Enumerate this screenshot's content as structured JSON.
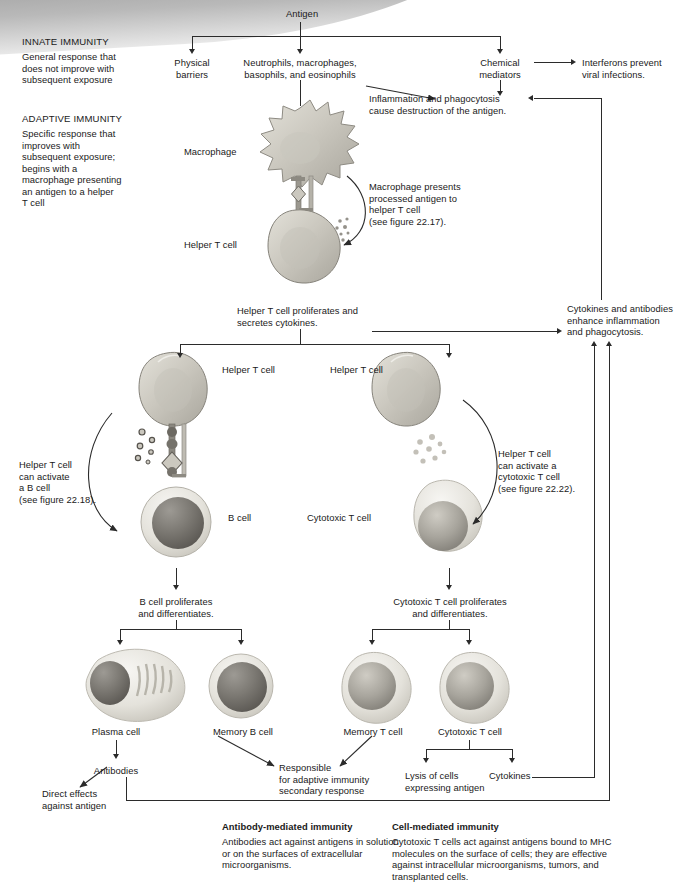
{
  "sidebar": {
    "innate": {
      "heading": "INNATE IMMUNITY",
      "body_lines": [
        "General response that",
        "does not improve with",
        "subsequent exposure"
      ]
    },
    "adaptive": {
      "heading": "ADAPTIVE IMMUNITY",
      "body_lines": [
        "Specific response that",
        "improves with",
        "subsequent exposure;",
        "begins with a",
        "macrophage presenting",
        "an antigen to a helper",
        "T cell"
      ]
    }
  },
  "nodes": {
    "antigen": "Antigen",
    "physical_barriers": [
      "Physical",
      "barriers"
    ],
    "phagocytes": [
      "Neutrophils, macrophages,",
      "basophils, and eosinophils"
    ],
    "chemical_mediators": [
      "Chemical",
      "mediators"
    ],
    "interferons": [
      "Interferons prevent",
      "viral infections."
    ],
    "inflammation": [
      "Inflammation and phagocytosis",
      "cause destruction of the antigen."
    ],
    "macrophage_label": "Macrophage",
    "helper_t_label": "Helper T cell",
    "macrophage_presents": [
      "Macrophage presents",
      "processed antigen to",
      "helper T cell",
      "(see figure 22.17)."
    ],
    "helper_proliferates": [
      "Helper T cell proliferates and",
      "secretes cytokines."
    ],
    "cytokines_antibodies": [
      "Cytokines and antibodies",
      "enhance inflammation",
      "and phagocytosis."
    ],
    "helper_t_left": "Helper T cell",
    "helper_t_right": "Helper T cell",
    "helper_activates_b": [
      "Helper T cell",
      "can activate",
      "a B cell",
      "(see figure 22.18)."
    ],
    "helper_activates_ctl": [
      "Helper T cell",
      "can activate a",
      "cytotoxic T cell",
      "(see figure 22.22)."
    ],
    "b_cell_label": "B cell",
    "cytotoxic_t_label": "Cytotoxic T cell",
    "b_proliferates": [
      "B cell proliferates",
      "and differentiates."
    ],
    "ctl_proliferates": [
      "Cytotoxic T cell proliferates",
      "and differentiates."
    ],
    "plasma_cell": "Plasma cell",
    "memory_b_cell": "Memory B cell",
    "memory_t_cell": "Memory T cell",
    "cytotoxic_t_cell_bottom": "Cytotoxic T cell",
    "antibodies": "Antibodies",
    "direct_effects": [
      "Direct effects",
      "against antigen"
    ],
    "responsible": [
      "Responsible",
      "for adaptive immunity",
      "secondary response"
    ],
    "lysis": [
      "Lysis of cells",
      "expressing antigen"
    ],
    "cytokines": "Cytokines"
  },
  "captions": {
    "antibody_mediated": {
      "heading": "Antibody-mediated immunity",
      "body_lines": [
        "Antibodies act against antigens in solution",
        "or on the surfaces of extracellular",
        "microorganisms."
      ]
    },
    "cell_mediated": {
      "heading": "Cell-mediated immunity",
      "body_lines": [
        "Cytotoxic T cells act against antigens bound to MHC",
        "molecules on the surface of cells; they are effective",
        "against intracellular microorganisms, tumors, and",
        "transplanted cells."
      ]
    }
  },
  "colors": {
    "line": "#2b2b2b",
    "text": "#1a1a1a",
    "banner_gray": "#8d8d8d",
    "cell_membrane": "#d8d6cf",
    "cell_nucleus": "#6e6b66",
    "cytokine_dot": "#9a9892"
  },
  "icons": {
    "macrophage": "macrophage-cell-icon",
    "helper_t": "helper-t-cell-icon",
    "b_cell": "b-cell-icon",
    "cytotoxic_t": "cytotoxic-t-cell-icon",
    "plasma_cell": "plasma-cell-icon",
    "memory_b": "memory-b-cell-icon",
    "memory_t": "memory-t-cell-icon",
    "cytokine_dots": "cytokine-dots-icon",
    "mhc_complex": "mhc-receptor-complex-icon"
  }
}
